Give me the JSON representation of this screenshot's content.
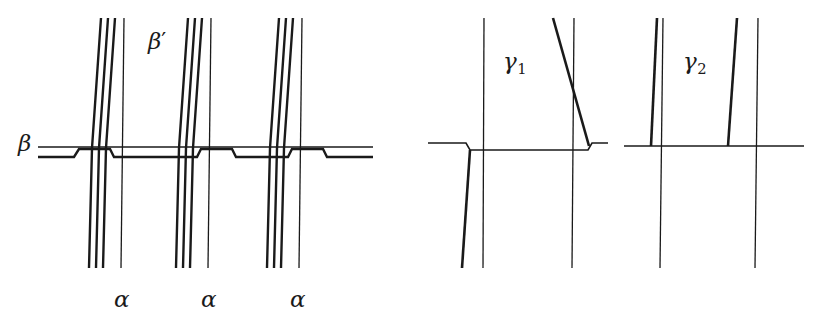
{
  "figure": {
    "kind": "mathematical-line-diagram",
    "width": 828,
    "height": 330,
    "background_color": "#ffffff",
    "ink_color": "#1a1a1a"
  },
  "labels": {
    "beta": "β",
    "beta_prime_base": "β",
    "beta_prime_mark": "′",
    "alpha_1": "α",
    "alpha_2": "α",
    "alpha_3": "α",
    "gamma_base": "γ",
    "gamma_1_sub": "1",
    "gamma_2_sub": "2"
  },
  "label_positions": {
    "beta": {
      "x": 18,
      "y": 132
    },
    "beta_prime": {
      "x": 148,
      "y": 30
    },
    "alpha_1": {
      "x": 114,
      "y": 288
    },
    "alpha_2": {
      "x": 201,
      "y": 288
    },
    "alpha_3": {
      "x": 290,
      "y": 288
    },
    "gamma_1": {
      "x": 503,
      "y": 50
    },
    "gamma_2": {
      "x": 683,
      "y": 50
    }
  },
  "chart_data": {
    "type": "line-diagram",
    "title": "",
    "panels": [
      {
        "name": "left-panel",
        "label": "beta-alpha panel",
        "horizontal_curves": [
          {
            "name": "beta-upper",
            "stroke_width": 1.5,
            "points": [
              [
                38,
                147
              ],
              [
                373,
                147
              ]
            ]
          },
          {
            "name": "beta-lower-jogged",
            "stroke_width": 2.4,
            "points": [
              [
                38,
                157
              ],
              [
                74,
                157
              ],
              [
                79,
                149
              ],
              [
                110,
                149
              ],
              [
                114,
                157
              ],
              [
                197,
                157
              ],
              [
                201,
                149
              ],
              [
                232,
                149
              ],
              [
                236,
                157
              ],
              [
                288,
                157
              ],
              [
                292,
                149
              ],
              [
                323,
                149
              ],
              [
                327,
                157
              ],
              [
                373,
                157
              ]
            ]
          }
        ],
        "vertical_groups": [
          {
            "name": "alpha-group-1",
            "lines": [
              {
                "name": "slant-1",
                "stroke_width": 2.4,
                "points": [
                  [
                    101,
                    18
                  ],
                  [
                    92,
                    148
                  ],
                  [
                    89,
                    268
                  ]
                ]
              },
              {
                "name": "slant-2",
                "stroke_width": 2.4,
                "points": [
                  [
                    108,
                    18
                  ],
                  [
                    99,
                    148
                  ],
                  [
                    96,
                    268
                  ]
                ]
              },
              {
                "name": "slant-3",
                "stroke_width": 2.4,
                "points": [
                  [
                    115,
                    18
                  ],
                  [
                    106,
                    148
                  ],
                  [
                    103,
                    268
                  ]
                ]
              },
              {
                "name": "thin-vertical",
                "stroke_width": 1.3,
                "points": [
                  [
                    124,
                    18
                  ],
                  [
                    121,
                    268
                  ]
                ]
              }
            ]
          },
          {
            "name": "alpha-group-2",
            "lines": [
              {
                "name": "slant-1",
                "stroke_width": 2.4,
                "points": [
                  [
                    188,
                    18
                  ],
                  [
                    179,
                    148
                  ],
                  [
                    176,
                    268
                  ]
                ]
              },
              {
                "name": "slant-2",
                "stroke_width": 2.4,
                "points": [
                  [
                    195,
                    18
                  ],
                  [
                    186,
                    148
                  ],
                  [
                    183,
                    268
                  ]
                ]
              },
              {
                "name": "slant-3",
                "stroke_width": 2.4,
                "points": [
                  [
                    202,
                    18
                  ],
                  [
                    193,
                    148
                  ],
                  [
                    190,
                    268
                  ]
                ]
              },
              {
                "name": "thin-vertical",
                "stroke_width": 1.3,
                "points": [
                  [
                    211,
                    18
                  ],
                  [
                    208,
                    268
                  ]
                ]
              }
            ]
          },
          {
            "name": "alpha-group-3",
            "lines": [
              {
                "name": "slant-1",
                "stroke_width": 2.4,
                "points": [
                  [
                    279,
                    18
                  ],
                  [
                    270,
                    148
                  ],
                  [
                    267,
                    268
                  ]
                ]
              },
              {
                "name": "slant-2",
                "stroke_width": 2.4,
                "points": [
                  [
                    286,
                    18
                  ],
                  [
                    277,
                    148
                  ],
                  [
                    274,
                    268
                  ]
                ]
              },
              {
                "name": "slant-3",
                "stroke_width": 2.4,
                "points": [
                  [
                    293,
                    18
                  ],
                  [
                    284,
                    148
                  ],
                  [
                    281,
                    268
                  ]
                ]
              },
              {
                "name": "thin-vertical",
                "stroke_width": 1.3,
                "points": [
                  [
                    302,
                    18
                  ],
                  [
                    299,
                    268
                  ]
                ]
              }
            ]
          }
        ]
      },
      {
        "name": "gamma-1-panel",
        "label": "gamma-1 panel",
        "horizontal_curves": [
          {
            "name": "gamma1-horizontal-jogged",
            "stroke_width": 1.6,
            "points": [
              [
                428,
                143
              ],
              [
                466,
                143
              ],
              [
                470,
                150
              ],
              [
                588,
                150
              ],
              [
                592,
                143
              ],
              [
                608,
                143
              ]
            ]
          }
        ],
        "vertical_groups": [
          {
            "name": "gamma1-lines",
            "lines": [
              {
                "name": "thin-vertical-left",
                "stroke_width": 1.3,
                "points": [
                  [
                    484,
                    18
                  ],
                  [
                    483,
                    268
                  ]
                ]
              },
              {
                "name": "thick-slant-descending",
                "stroke_width": 2.6,
                "points": [
                  [
                    470,
                    150
                  ],
                  [
                    462,
                    268
                  ]
                ]
              },
              {
                "name": "thick-slant-ascending",
                "stroke_width": 2.6,
                "points": [
                  [
                    553,
                    18
                  ],
                  [
                    589,
                    146
                  ]
                ]
              },
              {
                "name": "thin-vertical-right",
                "stroke_width": 1.3,
                "points": [
                  [
                    574,
                    18
                  ],
                  [
                    572,
                    268
                  ]
                ]
              }
            ]
          }
        ]
      },
      {
        "name": "gamma-2-panel",
        "label": "gamma-2 panel",
        "horizontal_curves": [
          {
            "name": "gamma2-horizontal",
            "stroke_width": 1.6,
            "points": [
              [
                624,
                146
              ],
              [
                804,
                146
              ]
            ]
          }
        ],
        "vertical_groups": [
          {
            "name": "gamma2-lines",
            "lines": [
              {
                "name": "thick-slant-left",
                "stroke_width": 2.6,
                "points": [
                  [
                    657,
                    18
                  ],
                  [
                    651,
                    146
                  ]
                ]
              },
              {
                "name": "thin-vertical-left",
                "stroke_width": 1.3,
                "points": [
                  [
                    663,
                    18
                  ],
                  [
                    660,
                    268
                  ]
                ]
              },
              {
                "name": "thick-slant-right",
                "stroke_width": 2.6,
                "points": [
                  [
                    737,
                    18
                  ],
                  [
                    728,
                    146
                  ]
                ]
              },
              {
                "name": "thin-vertical-right",
                "stroke_width": 1.3,
                "points": [
                  [
                    758,
                    18
                  ],
                  [
                    755,
                    268
                  ]
                ]
              }
            ]
          }
        ]
      }
    ]
  }
}
